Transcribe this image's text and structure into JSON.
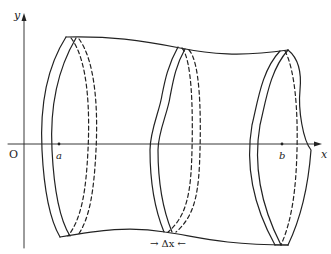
{
  "figure": {
    "axes": {
      "x_label": "x",
      "y_label": "y",
      "origin_label": "O"
    },
    "points": {
      "a_label": "a",
      "b_label": "b"
    },
    "annotation": {
      "delta_label": "→ Δx ←"
    },
    "colors": {
      "stroke": "#222222",
      "background": "#ffffff"
    }
  }
}
